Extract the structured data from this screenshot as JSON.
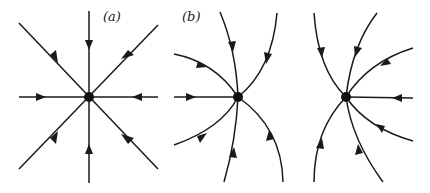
{
  "figure": {
    "panels": [
      {
        "id": "a",
        "label": "(a)",
        "type": "star node (proper node), all trajectories straight lines into origin",
        "center": [
          89,
          97
        ]
      },
      {
        "id": "b",
        "label": "(b)",
        "type": "improper node, curved trajectories tangent to vertical direction",
        "center": [
          238,
          97
        ]
      },
      {
        "id": "c",
        "label": "",
        "type": "improper node, mirror of (b)",
        "center": [
          346,
          97
        ]
      }
    ],
    "stroke_color": "#1a1a1a",
    "background": "#ffffff"
  }
}
